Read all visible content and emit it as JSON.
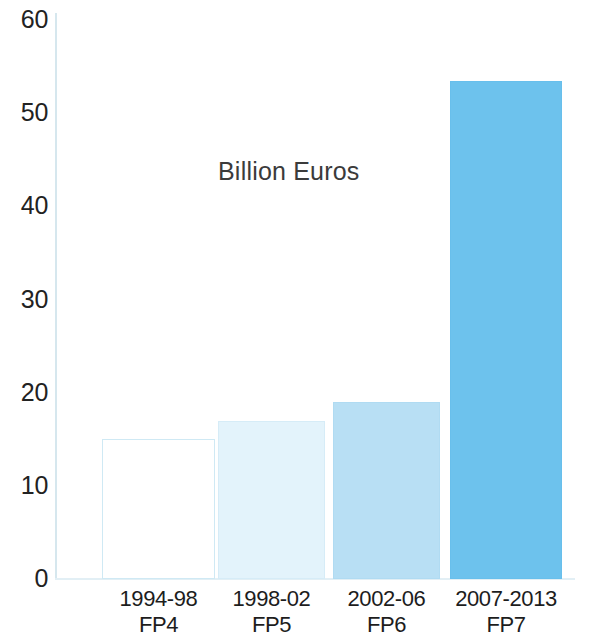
{
  "chart_data": {
    "type": "bar",
    "title": "Billion Euros",
    "xlabel": "",
    "ylabel": "",
    "categories": [
      "1994-98\nFP4",
      "1998-02\nFP5",
      "2002-06\nFP6",
      "2007-2013\nFP7"
    ],
    "category_lines": [
      {
        "period": "1994-98",
        "programme": "FP4"
      },
      {
        "period": "1998-02",
        "programme": "FP5"
      },
      {
        "period": "2002-06",
        "programme": "FP6"
      },
      {
        "period": "2007-2013",
        "programme": "FP7"
      }
    ],
    "values": [
      15,
      17,
      19,
      53.5
    ],
    "ylim": [
      0,
      60
    ],
    "y_ticks": [
      "0",
      "10",
      "20",
      "30",
      "40",
      "50",
      "60"
    ],
    "y_tick_values": [
      0,
      10,
      20,
      30,
      40,
      50,
      60
    ],
    "grid": false,
    "legend": "none",
    "bar_colors": [
      "#ffffff",
      "#e3f3fb",
      "#b8dff4",
      "#6dc2ed"
    ],
    "bar_border_colors": [
      "#cfe9f4",
      "#d6ecf7",
      "#b0dbf2",
      "#68bfec"
    ],
    "bar_styles": [
      "style-outline",
      "style-pale",
      "style-light",
      "style-medium"
    ],
    "axis_color": "#d6e7ee",
    "text_color": "#1d1d1d",
    "background": "#ffffff"
  }
}
